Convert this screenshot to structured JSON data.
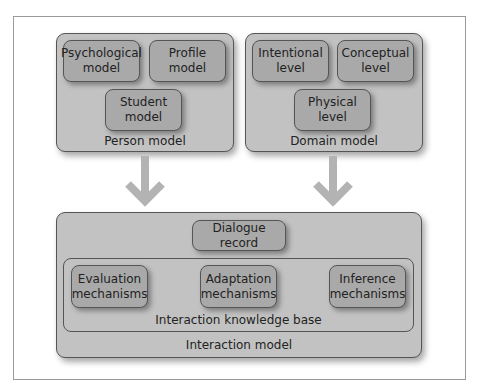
{
  "diagram": {
    "person_model": {
      "label": "Person model",
      "components": [
        {
          "label": "Psychological\nmodel"
        },
        {
          "label": "Profile\nmodel"
        },
        {
          "label": "Student\nmodel"
        }
      ]
    },
    "domain_model": {
      "label": "Domain model",
      "components": [
        {
          "label": "Intentional\nlevel"
        },
        {
          "label": "Conceptual\nlevel"
        },
        {
          "label": "Physical\nlevel"
        }
      ]
    },
    "interaction_model": {
      "label": "Interaction model",
      "dialogue_record": "Dialogue record",
      "knowledge_base": {
        "label": "Interaction knowledge base",
        "components": [
          {
            "label": "Evaluation\nmechanisms"
          },
          {
            "label": "Adaptation\nmechanisms"
          },
          {
            "label": "Inference\nmechanisms"
          }
        ]
      }
    },
    "arrows": [
      {
        "from": "Person model",
        "to": "Interaction model"
      },
      {
        "from": "Domain model",
        "to": "Interaction model"
      }
    ],
    "colors": {
      "outer_box": "#c2c2c2",
      "inner_box": "#a9a9a9",
      "arrow": "#b3b3b3",
      "border": "#555555"
    }
  }
}
